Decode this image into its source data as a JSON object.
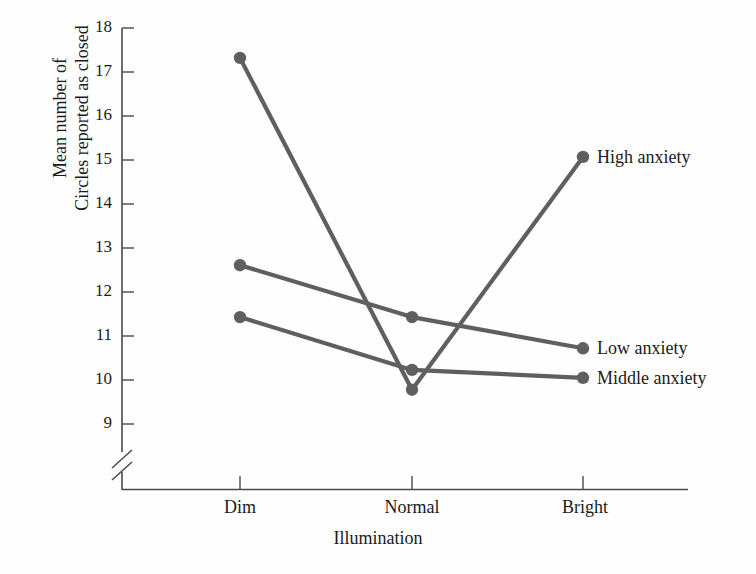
{
  "chart_data": {
    "type": "line",
    "title": "",
    "xlabel": "Illumination",
    "ylabel_lines": [
      "Mean number of",
      "Circles reported as closed"
    ],
    "categories": [
      "Dim",
      "Normal",
      "Bright"
    ],
    "ylim": [
      9,
      18
    ],
    "yticks": [
      9,
      10,
      11,
      12,
      13,
      14,
      15,
      16,
      17,
      18
    ],
    "ytick_labels": [
      "9",
      "10",
      "11",
      "12",
      "13",
      "14",
      "15",
      "16",
      "17",
      "18"
    ],
    "y_axis_break": true,
    "grid": false,
    "legend_position": "right-of-endpoints",
    "series": [
      {
        "name": "High anxiety",
        "values": [
          17.32,
          9.78,
          15.07
        ],
        "color": "#5f5f5f"
      },
      {
        "name": "Low anxiety",
        "values": [
          12.61,
          11.43,
          10.72
        ],
        "color": "#5f5f5f"
      },
      {
        "name": "Middle anxiety",
        "values": [
          11.43,
          10.23,
          10.05
        ],
        "color": "#5f5f5f"
      }
    ]
  },
  "axis": {
    "line_color": "#4a4a4a",
    "tick_color": "#4a4a4a"
  },
  "ticks": {
    "t18": "18",
    "t17": "17",
    "t16": "16",
    "t15": "15",
    "t14": "14",
    "t13": "13",
    "t12": "12",
    "t11": "11",
    "t10": "10",
    "t9": "9"
  },
  "categories": {
    "c0": "Dim",
    "c1": "Normal",
    "c2": "Bright"
  },
  "legend": {
    "high": "High anxiety",
    "low": "Low anxiety",
    "middle": "Middle anxiety"
  },
  "labels": {
    "xlabel": "Illumination",
    "ylabel_line1": "Mean number of",
    "ylabel_line2": "Circles reported as closed"
  }
}
